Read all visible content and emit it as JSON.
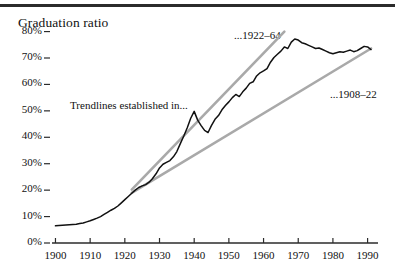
{
  "figure": {
    "title": "Graduation ratio",
    "annotations": {
      "trendlines_note": "Trendlines established in...",
      "upper_trendline": "...1922–64",
      "lower_trendline": "...1908–22"
    }
  },
  "chart_data": {
    "type": "line",
    "title": "Graduation ratio",
    "xlabel": "",
    "ylabel": "Graduation ratio",
    "xlim": [
      1899,
      1993
    ],
    "ylim": [
      0,
      84
    ],
    "grid": false,
    "legend": "none",
    "xticks": [
      1900,
      1910,
      1920,
      1930,
      1940,
      1950,
      1960,
      1970,
      1980,
      1990
    ],
    "xticklabels": [
      "1900",
      "1910",
      "1920",
      "1930",
      "1940",
      "1950",
      "1960",
      "1970",
      "1980",
      "1990"
    ],
    "yticks": [
      0,
      10,
      20,
      30,
      40,
      50,
      60,
      70,
      80
    ],
    "yticklabels": [
      "0%",
      "10%",
      "20%",
      "30%",
      "40%",
      "50%",
      "60%",
      "70%",
      "80%"
    ],
    "series": [
      {
        "name": "Graduation ratio",
        "color": "#111111",
        "style": "solid",
        "x": [
          1900,
          1901,
          1902,
          1903,
          1904,
          1905,
          1906,
          1907,
          1908,
          1909,
          1910,
          1911,
          1912,
          1913,
          1914,
          1915,
          1916,
          1917,
          1918,
          1919,
          1920,
          1921,
          1922,
          1923,
          1924,
          1925,
          1926,
          1927,
          1928,
          1929,
          1930,
          1931,
          1932,
          1933,
          1934,
          1935,
          1936,
          1937,
          1938,
          1939,
          1940,
          1941,
          1942,
          1943,
          1944,
          1945,
          1946,
          1947,
          1948,
          1949,
          1950,
          1951,
          1952,
          1953,
          1954,
          1955,
          1956,
          1957,
          1958,
          1959,
          1960,
          1961,
          1962,
          1963,
          1964,
          1965,
          1966,
          1967,
          1968,
          1969,
          1970,
          1971,
          1972,
          1973,
          1974,
          1975,
          1976,
          1977,
          1978,
          1979,
          1980,
          1981,
          1982,
          1983,
          1984,
          1985,
          1986,
          1987,
          1988,
          1989,
          1990,
          1991
        ],
        "values": [
          6.5,
          6.6,
          6.7,
          6.8,
          6.9,
          7.0,
          7.1,
          7.4,
          7.6,
          8.0,
          8.4,
          8.9,
          9.4,
          10.0,
          10.8,
          11.6,
          12.4,
          13.1,
          14.0,
          15.2,
          16.4,
          17.6,
          18.8,
          20.0,
          21.0,
          21.6,
          22.1,
          23.0,
          24.4,
          26.2,
          28.4,
          29.8,
          30.5,
          31.2,
          32.6,
          34.6,
          37.6,
          40.5,
          43.6,
          47.2,
          49.8,
          46.5,
          44.4,
          42.6,
          41.8,
          44.5,
          46.8,
          48.2,
          50.4,
          52.0,
          53.4,
          55.0,
          56.2,
          55.4,
          57.2,
          58.6,
          60.4,
          61.0,
          63.2,
          64.4,
          65.1,
          66.0,
          68.4,
          70.2,
          71.4,
          72.6,
          74.2,
          73.6,
          76.0,
          77.2,
          76.8,
          75.8,
          75.4,
          74.8,
          74.2,
          73.6,
          73.8,
          73.2,
          72.6,
          72.0,
          71.6,
          72.0,
          72.4,
          72.2,
          72.6,
          73.0,
          72.4,
          72.8,
          73.6,
          74.4,
          74.2,
          73.2
        ]
      },
      {
        "name": "Trendline 1922–64",
        "color": "#a9a9a9",
        "style": "solid",
        "x": [
          1922,
          1966
        ],
        "values": [
          20.2,
          80.0
        ]
      },
      {
        "name": "Trendline 1908–22",
        "color": "#a9a9a9",
        "style": "solid",
        "x": [
          1922,
          1991
        ],
        "values": [
          19.0,
          73.6
        ]
      }
    ],
    "annotations": [
      {
        "text": "Trendlines established in...",
        "x": 1913,
        "y": 57
      },
      {
        "text": "...1922–64",
        "x": 1955,
        "y": 82
      },
      {
        "text": "...1908–22",
        "x": 1979,
        "y": 58
      }
    ]
  }
}
